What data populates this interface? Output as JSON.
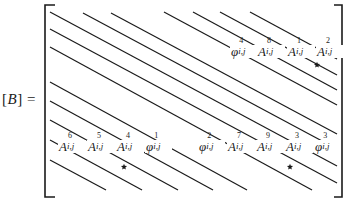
{
  "equation": {
    "lhs_open": "[",
    "lhs_symbol": "B",
    "lhs_close": "]",
    "equals": "="
  },
  "matrix": {
    "bracket_color": "#1a1a1a",
    "line_color": "#1a1a1a",
    "left_bracket": {
      "x": 45,
      "top": 5,
      "bottom": 197,
      "tick": 10
    },
    "right_bracket": {
      "x": 342,
      "top": 5,
      "bottom": 197,
      "tick": 8
    },
    "diagonals": [
      {
        "x1": 50,
        "y1": 12,
        "x2": 337,
        "y2": 166
      },
      {
        "x1": 83,
        "y1": 13,
        "x2": 337,
        "y2": 149
      },
      {
        "x1": 111,
        "y1": 13,
        "x2": 337,
        "y2": 134
      },
      {
        "x1": 164,
        "y1": 12,
        "x2": 337,
        "y2": 105
      },
      {
        "x1": 193,
        "y1": 12,
        "x2": 337,
        "y2": 90
      },
      {
        "x1": 220,
        "y1": 12,
        "x2": 337,
        "y2": 75
      },
      {
        "x1": 250,
        "y1": 12,
        "x2": 337,
        "y2": 59
      },
      {
        "x1": 50,
        "y1": 29,
        "x2": 337,
        "y2": 183
      },
      {
        "x1": 50,
        "y1": 47,
        "x2": 312,
        "y2": 190
      },
      {
        "x1": 50,
        "y1": 82,
        "x2": 247,
        "y2": 190
      },
      {
        "x1": 50,
        "y1": 101,
        "x2": 213,
        "y2": 190
      },
      {
        "x1": 50,
        "y1": 120,
        "x2": 178,
        "y2": 190
      },
      {
        "x1": 50,
        "y1": 140,
        "x2": 142,
        "y2": 190
      },
      {
        "x1": 50,
        "y1": 160,
        "x2": 106,
        "y2": 190
      }
    ],
    "stars": [
      {
        "x": 317,
        "y": 65
      },
      {
        "x": 124,
        "y": 167
      },
      {
        "x": 290,
        "y": 167
      }
    ]
  },
  "terms": [
    {
      "id": "phi4",
      "base": "φ",
      "sup": "4",
      "sub": "i,j",
      "x": 230,
      "y": 45
    },
    {
      "id": "A8",
      "base": "A",
      "sup": "8",
      "sub": "i,j",
      "x": 257,
      "y": 45
    },
    {
      "id": "A1",
      "base": "A",
      "sup": "1",
      "sub": "i,j",
      "x": 287,
      "y": 45
    },
    {
      "id": "A2",
      "base": "A",
      "sup": "2",
      "sub": "i,j",
      "x": 316,
      "y": 45
    },
    {
      "id": "A6",
      "base": "A",
      "sup": "6",
      "sub": "i,j",
      "x": 58,
      "y": 140
    },
    {
      "id": "A5",
      "base": "A",
      "sup": "5",
      "sub": "i,j",
      "x": 87,
      "y": 140
    },
    {
      "id": "A4",
      "base": "A",
      "sup": "4",
      "sub": "i,j",
      "x": 116,
      "y": 140
    },
    {
      "id": "phi1",
      "base": "φ",
      "sup": "1",
      "sub": "i,j",
      "x": 145,
      "y": 140
    },
    {
      "id": "phi2",
      "base": "φ",
      "sup": "2",
      "sub": "i,j",
      "x": 198,
      "y": 140
    },
    {
      "id": "A7",
      "base": "A",
      "sup": "7",
      "sub": "i,j",
      "x": 227,
      "y": 140
    },
    {
      "id": "A9",
      "base": "A",
      "sup": "9",
      "sub": "i,j",
      "x": 256,
      "y": 140
    },
    {
      "id": "A3",
      "base": "A",
      "sup": "3",
      "sub": "i,j",
      "x": 285,
      "y": 140
    },
    {
      "id": "phi3",
      "base": "φ",
      "sup": "3",
      "sub": "i,j",
      "x": 314,
      "y": 140
    }
  ]
}
